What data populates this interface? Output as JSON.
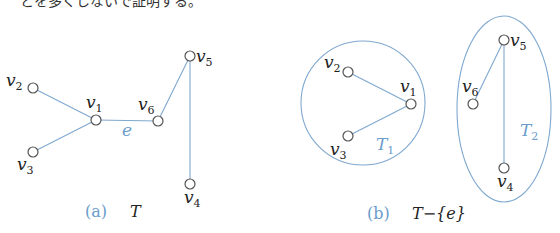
{
  "colors": {
    "edge": "#7fa8cf",
    "node_stroke": "#555555",
    "label": "#222222",
    "accent": "#6a9ccc"
  },
  "top_text": "とを多くしないで証明する。",
  "figure_a": {
    "caption_tag": "(a)",
    "caption_text": "T",
    "edge_label": "e",
    "nodes": [
      {
        "id": "v1",
        "base": "v",
        "sub": "1",
        "x": 96,
        "y": 120
      },
      {
        "id": "v2",
        "base": "v",
        "sub": "2",
        "x": 33,
        "y": 88
      },
      {
        "id": "v3",
        "base": "v",
        "sub": "3",
        "x": 33,
        "y": 152
      },
      {
        "id": "v4",
        "base": "v",
        "sub": "4",
        "x": 190,
        "y": 184
      },
      {
        "id": "v5",
        "base": "v",
        "sub": "5",
        "x": 190,
        "y": 56
      },
      {
        "id": "v6",
        "base": "v",
        "sub": "6",
        "x": 158,
        "y": 121
      }
    ],
    "edges": [
      [
        "v2",
        "v1"
      ],
      [
        "v3",
        "v1"
      ],
      [
        "v1",
        "v6"
      ],
      [
        "v6",
        "v5"
      ],
      [
        "v5",
        "v4"
      ]
    ]
  },
  "figure_b": {
    "caption_tag": "(b)",
    "caption_text": "T−{e}",
    "components": [
      {
        "name": "T",
        "sub": "1",
        "nodes": [
          "v1",
          "v2",
          "v3"
        ]
      },
      {
        "name": "T",
        "sub": "2",
        "nodes": [
          "v4",
          "v5",
          "v6"
        ]
      }
    ],
    "nodes": [
      {
        "id": "v1",
        "base": "v",
        "sub": "1",
        "x": 411,
        "y": 104
      },
      {
        "id": "v2",
        "base": "v",
        "sub": "2",
        "x": 348,
        "y": 72
      },
      {
        "id": "v3",
        "base": "v",
        "sub": "3",
        "x": 348,
        "y": 136
      },
      {
        "id": "v4",
        "base": "v",
        "sub": "4",
        "x": 504,
        "y": 168
      },
      {
        "id": "v5",
        "base": "v",
        "sub": "5",
        "x": 504,
        "y": 40
      },
      {
        "id": "v6",
        "base": "v",
        "sub": "6",
        "x": 473,
        "y": 104
      }
    ],
    "edges": [
      [
        "v2",
        "v1"
      ],
      [
        "v3",
        "v1"
      ],
      [
        "v6",
        "v5"
      ],
      [
        "v5",
        "v4"
      ]
    ]
  }
}
